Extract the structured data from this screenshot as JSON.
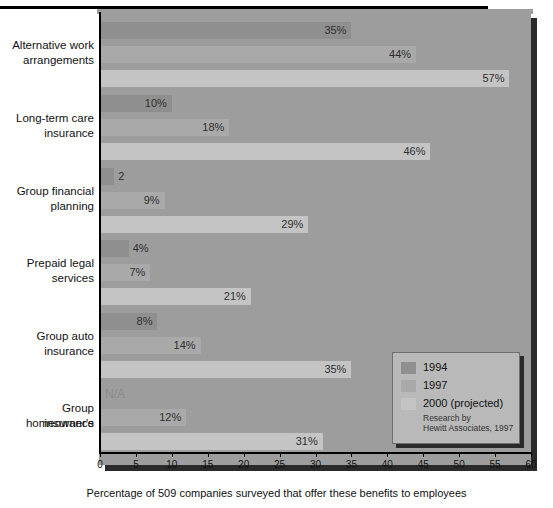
{
  "chart_data": {
    "type": "bar",
    "orientation": "horizontal",
    "title": "",
    "xlabel": "Percentage of 509 companies surveyed that offer these benefits to employees",
    "ylabel": "",
    "xlim": [
      0,
      60
    ],
    "xticks": [
      0,
      5,
      10,
      15,
      20,
      25,
      30,
      35,
      40,
      45,
      50,
      55,
      60
    ],
    "grid": false,
    "legend_position": "bottom-right",
    "categories": [
      "Alternative work arrangements",
      "Long-term care insurance",
      "Group financial planning",
      "Prepaid legal services",
      "Group auto insurance",
      "Group homeowner's insurance"
    ],
    "category_lines": [
      [
        "Alternative work",
        "arrangements"
      ],
      [
        "Long-term care",
        "insurance"
      ],
      [
        "Group financial",
        "planning"
      ],
      [
        "Prepaid legal",
        "services"
      ],
      [
        "Group auto",
        "insurance"
      ],
      [
        "Group homeowner's",
        "insurance"
      ]
    ],
    "series": [
      {
        "name": "1994",
        "color": "#8f8f8f",
        "values": [
          35,
          10,
          2,
          4,
          8,
          null
        ],
        "labels": [
          "35%",
          "10%",
          "2",
          "4%",
          "8%",
          "N/A"
        ]
      },
      {
        "name": "1997",
        "color": "#a9a9a9",
        "values": [
          44,
          18,
          9,
          7,
          14,
          12
        ],
        "labels": [
          "44%",
          "18%",
          "9%",
          "7%",
          "14%",
          "12%"
        ]
      },
      {
        "name": "2000 (projected)",
        "color": "#c4c4c4",
        "values": [
          57,
          46,
          29,
          21,
          35,
          31
        ],
        "labels": [
          "57%",
          "46%",
          "29%",
          "21%",
          "35%",
          "31%"
        ]
      }
    ]
  },
  "legend": {
    "items": [
      {
        "label": "1994",
        "color": "#8f8f8f"
      },
      {
        "label": "1997",
        "color": "#a9a9a9"
      },
      {
        "label": "2000 (projected)",
        "color": "#c4c4c4"
      }
    ],
    "note_line1": "Research by",
    "note_line2": "Hewitt Associates, 1997"
  }
}
